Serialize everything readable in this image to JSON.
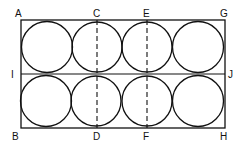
{
  "diagram": {
    "rectangle": {
      "x": 21,
      "y": 20,
      "width": 204,
      "height": 108
    },
    "midline": {
      "from": "I",
      "to": "J",
      "y": 74
    },
    "dashed_lines": [
      {
        "from": "C",
        "to": "D",
        "x": 97
      },
      {
        "from": "E",
        "to": "F",
        "x": 147
      }
    ],
    "circles": {
      "rows": 2,
      "cols": 4,
      "radius": 25
    },
    "labels": {
      "A": "A",
      "C": "C",
      "E": "E",
      "G": "G",
      "I": "I",
      "J": "J",
      "B": "B",
      "D": "D",
      "F": "F",
      "H": "H"
    },
    "colors": {
      "stroke": "#111111",
      "background": "#ffffff"
    }
  }
}
